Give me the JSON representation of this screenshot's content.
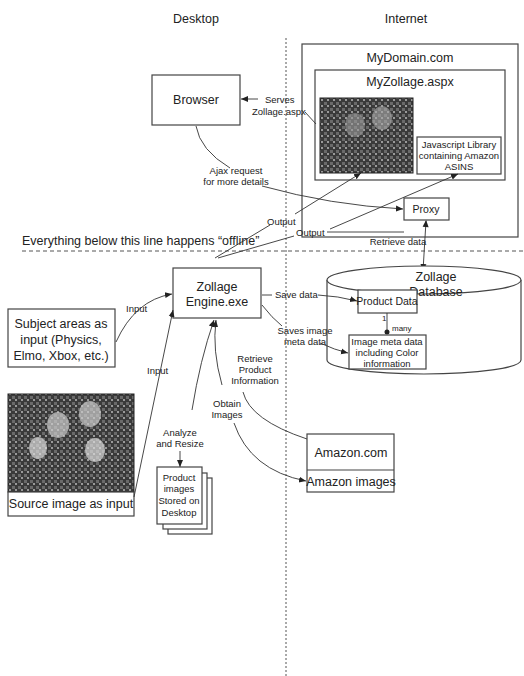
{
  "regions": {
    "desktop_label": "Desktop",
    "internet_label": "Internet",
    "offline_note": "Everything below this line happens “offline”"
  },
  "nodes": {
    "browser": "Browser",
    "mydomain": "MyDomain.com",
    "myzollage": "MyZollage.aspx",
    "js_library": [
      "Javascript Library",
      "containing Amazon",
      "ASINS"
    ],
    "proxy": "Proxy",
    "engine": [
      "Zollage",
      "Engine.exe"
    ],
    "subject_areas": [
      "Subject areas as",
      "input (Physics,",
      "Elmo, Xbox, etc.)"
    ],
    "source_image": "Source image as input",
    "product_images": [
      "Product",
      "images",
      "Stored on",
      "Desktop"
    ],
    "database": [
      "Zollage",
      "Database"
    ],
    "product_data": "Product Data",
    "image_meta": [
      "Image meta data",
      "including Color",
      "information"
    ],
    "amazon_com": "Amazon.com",
    "amazon_images": "Amazon images"
  },
  "edges": {
    "serves": [
      "Serves",
      "Zollage.aspx"
    ],
    "ajax": [
      "Ajax request",
      "for more details"
    ],
    "output1": "Output",
    "output2": "Output",
    "retrieve_data": "Retrieve data",
    "input1": "Input",
    "input2": "Input",
    "save_data": "Save data",
    "saves_image_meta": [
      "Saves image",
      "meta data"
    ],
    "retrieve_product": [
      "Retrieve",
      "Product",
      "Information"
    ],
    "obtain_images": [
      "Obtain",
      "Images"
    ],
    "analyze_resize": [
      "Analyze",
      "and Resize"
    ],
    "cardinality_one": "1",
    "cardinality_many": "many"
  },
  "colors": {
    "line": "#333333",
    "box_border": "#444444",
    "background": "#ffffff"
  }
}
